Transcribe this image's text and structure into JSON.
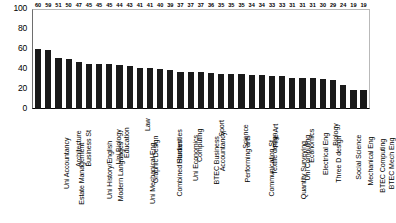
{
  "chart_data": {
    "type": "bar",
    "title": "",
    "subtitle": "",
    "xlabel": "",
    "ylabel": "",
    "ylim": [
      0,
      100
    ],
    "yticks": [
      100,
      80,
      60,
      40,
      20,
      0
    ],
    "grid": false,
    "legend": null,
    "bar_color": "#1a1a1a",
    "show_value_labels": true,
    "categories": [
      "Uni Accountancy",
      "Estate Management",
      "Architecture",
      "Business St",
      "Uni History/English",
      "Modern Languages",
      "Uni Biology",
      "Education",
      "Uni Mechanical Eng",
      "Graphic Design",
      "Law",
      "Combined Studies",
      "Humanities",
      "Uni Economics",
      "Computing",
      "BTEC Business",
      "Accountancy",
      "Sport",
      "Performing arts",
      "Science",
      "Communication St",
      "Textile design",
      "Fine Art",
      "Quantity Surveying",
      "Uni Computing",
      "Economics",
      "Electrical Eng",
      "Three D design",
      "Biology",
      "Social Science",
      "Mechanical Eng",
      "BTEC Computing",
      "BTEC Mech Eng"
    ],
    "values": [
      60,
      59,
      51,
      50,
      47,
      45,
      45,
      45,
      44,
      43,
      41,
      41,
      40,
      39,
      37,
      37,
      37,
      36,
      35,
      35,
      35,
      34,
      34,
      33,
      33,
      31,
      31,
      31,
      30,
      29,
      24,
      19,
      19
    ]
  }
}
